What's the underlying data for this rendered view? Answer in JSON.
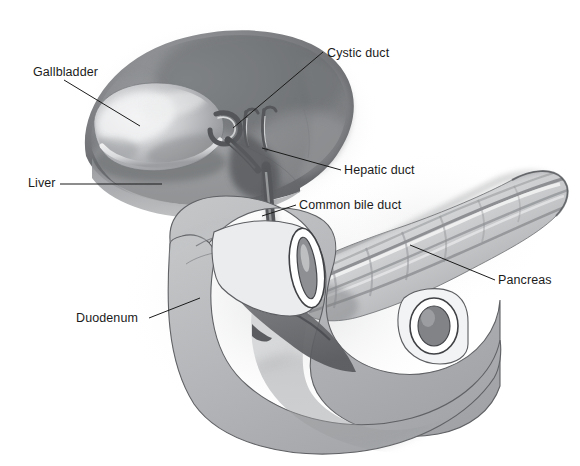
{
  "figure": {
    "background_color": "#ffffff",
    "width": 580,
    "height": 466,
    "style": "grayscale airbrush medical illustration"
  },
  "labels": {
    "gallbladder": "Gallbladder",
    "liver": "Liver",
    "duodenum": "Duodenum",
    "cystic_duct": "Cystic duct",
    "hepatic_duct": "Hepatic duct",
    "common_bile_duct": "Common bile duct",
    "pancreas": "Pancreas"
  },
  "colors": {
    "text": "#1b1b1b",
    "leader_line": "#1b1b1b",
    "liver_dark": "#6f7073",
    "liver_mid": "#8d8f92",
    "gallbladder_light": "#d7d8da",
    "duodenum_fill": "#b2b4b6",
    "pancreas_light": "#e9eaec",
    "pancreas_shadow": "#7b7d80",
    "outline": "#3a3a3c"
  },
  "structures": [
    {
      "name": "liver",
      "label": "Liver",
      "tone": "dark gray lobe, upper left, large wedge"
    },
    {
      "name": "gallbladder",
      "label": "Gallbladder",
      "tone": "light pear-shaped sac on liver underside"
    },
    {
      "name": "cystic-duct",
      "label": "Cystic duct",
      "tone": "short duct from gallbladder neck"
    },
    {
      "name": "hepatic-duct",
      "label": "Hepatic duct",
      "tone": "branched duct descending from liver"
    },
    {
      "name": "common-bile-duct",
      "label": "Common bile duct",
      "tone": "vertical duct entering duodenum"
    },
    {
      "name": "pancreas",
      "label": "Pancreas",
      "tone": "elongated lobulated gland to the right"
    },
    {
      "name": "duodenum",
      "label": "Duodenum",
      "tone": "C-shaped loop of bowel, cut ends visible"
    }
  ],
  "leader_lines": [
    {
      "name": "gallbladder-leader",
      "from": [
        64,
        80
      ],
      "to": [
        137,
        124
      ]
    },
    {
      "name": "liver-leader",
      "from": [
        62,
        184
      ],
      "to": [
        160,
        184
      ]
    },
    {
      "name": "duodenum-leader",
      "from": [
        150,
        318
      ],
      "to": [
        199,
        298
      ]
    },
    {
      "name": "cystic-duct-leader",
      "from": [
        322,
        52
      ],
      "to": [
        233,
        128
      ]
    },
    {
      "name": "hepatic-duct-leader",
      "from": [
        340,
        170
      ],
      "to": [
        262,
        148
      ]
    },
    {
      "name": "common-bile-duct-leader",
      "from": [
        295,
        205
      ],
      "to": [
        262,
        216
      ]
    },
    {
      "name": "pancreas-leader",
      "from": [
        494,
        280
      ],
      "to": [
        410,
        245
      ]
    }
  ]
}
